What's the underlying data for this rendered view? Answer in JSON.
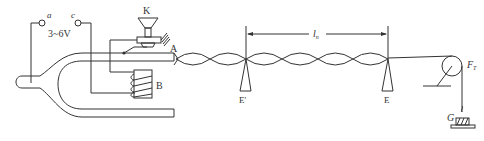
{
  "labels": {
    "terminal_a": "a",
    "terminal_c": "c",
    "voltage": "3~6V",
    "vibrator": "K",
    "string_end": "A",
    "coil": "B",
    "bridge_left": "E'",
    "bridge_right": "E",
    "length_main": "l",
    "length_sub": "n",
    "tension_main": "F",
    "tension_sub": "T",
    "weight": "G"
  },
  "wave": {
    "nodes_x": [
      175,
      210,
      246,
      282,
      318,
      353,
      388
    ],
    "center_y": 59,
    "amplitude": 8
  },
  "colors": {
    "line": "#333333",
    "background": "#ffffff"
  }
}
